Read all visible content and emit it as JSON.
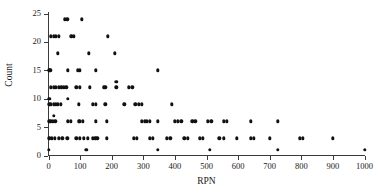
{
  "chart_data": {
    "type": "scatter",
    "title": "",
    "xlabel": "RPN",
    "ylabel": "Count",
    "xlim": [
      0,
      1000
    ],
    "ylim": [
      0,
      25
    ],
    "grid": false,
    "legend": null,
    "xticks": [
      0,
      100,
      200,
      300,
      400,
      500,
      600,
      700,
      800,
      900,
      1000
    ],
    "xtick_labels": [
      "0",
      "100",
      "200",
      "300",
      "400",
      "500",
      "600",
      "700",
      "800",
      "900",
      "1000"
    ],
    "yticks": [
      0,
      5,
      10,
      15,
      20,
      25
    ],
    "ytick_labels": [
      "0",
      "5",
      "10",
      "15",
      "20",
      "25"
    ],
    "marker": "diamond-filled",
    "marker_color": "#111111",
    "axis_color": "#3a3a3a",
    "points": [
      [
        52,
        24
      ],
      [
        60,
        24
      ],
      [
        105,
        24
      ],
      [
        8,
        21
      ],
      [
        16,
        21
      ],
      [
        24,
        21
      ],
      [
        32,
        21
      ],
      [
        72,
        21
      ],
      [
        80,
        21
      ],
      [
        188,
        21
      ],
      [
        30,
        18
      ],
      [
        128,
        18
      ],
      [
        210,
        18
      ],
      [
        2,
        15
      ],
      [
        6,
        15
      ],
      [
        62,
        15
      ],
      [
        92,
        15
      ],
      [
        100,
        15
      ],
      [
        150,
        15
      ],
      [
        345,
        15
      ],
      [
        215,
        13
      ],
      [
        8,
        12
      ],
      [
        16,
        12
      ],
      [
        24,
        12
      ],
      [
        32,
        12
      ],
      [
        40,
        12
      ],
      [
        48,
        12
      ],
      [
        56,
        12
      ],
      [
        88,
        12
      ],
      [
        100,
        12
      ],
      [
        130,
        12
      ],
      [
        175,
        12
      ],
      [
        180,
        12
      ],
      [
        215,
        12
      ],
      [
        255,
        12
      ],
      [
        265,
        12
      ],
      [
        2,
        10
      ],
      [
        62,
        10
      ],
      [
        2,
        9
      ],
      [
        8,
        9
      ],
      [
        16,
        9
      ],
      [
        24,
        9
      ],
      [
        30,
        9
      ],
      [
        38,
        9
      ],
      [
        95,
        9
      ],
      [
        140,
        9
      ],
      [
        150,
        9
      ],
      [
        180,
        9
      ],
      [
        240,
        9
      ],
      [
        275,
        9
      ],
      [
        285,
        9
      ],
      [
        295,
        9
      ],
      [
        390,
        9
      ],
      [
        16,
        7
      ],
      [
        2,
        6
      ],
      [
        8,
        6
      ],
      [
        14,
        6
      ],
      [
        22,
        6
      ],
      [
        62,
        6
      ],
      [
        70,
        6
      ],
      [
        95,
        6
      ],
      [
        100,
        6
      ],
      [
        108,
        6
      ],
      [
        150,
        6
      ],
      [
        185,
        6
      ],
      [
        295,
        6
      ],
      [
        305,
        6
      ],
      [
        312,
        6
      ],
      [
        320,
        6
      ],
      [
        345,
        6
      ],
      [
        400,
        6
      ],
      [
        410,
        6
      ],
      [
        420,
        6
      ],
      [
        455,
        6
      ],
      [
        465,
        6
      ],
      [
        505,
        6
      ],
      [
        515,
        6
      ],
      [
        555,
        6
      ],
      [
        565,
        6
      ],
      [
        640,
        6
      ],
      [
        725,
        6
      ],
      [
        2,
        3
      ],
      [
        10,
        3
      ],
      [
        20,
        3
      ],
      [
        32,
        3
      ],
      [
        44,
        3
      ],
      [
        60,
        3
      ],
      [
        88,
        3
      ],
      [
        100,
        3
      ],
      [
        112,
        3
      ],
      [
        125,
        3
      ],
      [
        140,
        3
      ],
      [
        148,
        3
      ],
      [
        155,
        3
      ],
      [
        185,
        3
      ],
      [
        270,
        3
      ],
      [
        280,
        3
      ],
      [
        320,
        3
      ],
      [
        330,
        3
      ],
      [
        375,
        3
      ],
      [
        385,
        3
      ],
      [
        430,
        3
      ],
      [
        440,
        3
      ],
      [
        478,
        3
      ],
      [
        488,
        3
      ],
      [
        540,
        3
      ],
      [
        555,
        3
      ],
      [
        595,
        3
      ],
      [
        640,
        3
      ],
      [
        650,
        3
      ],
      [
        700,
        3
      ],
      [
        795,
        3
      ],
      [
        805,
        3
      ],
      [
        900,
        3
      ],
      [
        0,
        1
      ],
      [
        120,
        1
      ],
      [
        345,
        1
      ],
      [
        510,
        1
      ],
      [
        725,
        1
      ],
      [
        1000,
        1
      ]
    ]
  }
}
